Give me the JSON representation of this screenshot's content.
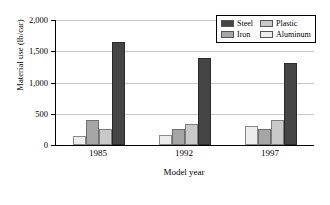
{
  "chart_data": {
    "type": "bar",
    "title": "",
    "xlabel": "Model year",
    "ylabel": "Material use (lb/car)",
    "categories": [
      "1985",
      "1992",
      "1997"
    ],
    "series": [
      {
        "name": "Aluminum",
        "color": "#ededed",
        "values": [
          140,
          160,
          300
        ]
      },
      {
        "name": "Iron",
        "color": "#a6a6a6",
        "values": [
          400,
          250,
          250
        ]
      },
      {
        "name": "Plastic",
        "color": "#c9c9c9",
        "values": [
          260,
          340,
          400
        ]
      },
      {
        "name": "Steel",
        "color": "#454545",
        "values": [
          1650,
          1400,
          1320
        ]
      }
    ],
    "ylim": [
      0,
      2000
    ],
    "yticks": [
      "0",
      "500",
      "1,000",
      "1,500",
      "2,000"
    ],
    "ytick_values": [
      0,
      500,
      1000,
      1500,
      2000
    ],
    "grid": true,
    "legend_position": "top-right",
    "legend_order": [
      "Steel",
      "Plastic",
      "Iron",
      "Aluminum"
    ],
    "bar_order_in_group": [
      "Aluminum",
      "Iron",
      "Plastic",
      "Steel"
    ]
  },
  "legend": {
    "entries": [
      {
        "label": "Steel",
        "swatch": "steel-swatch"
      },
      {
        "label": "Plastic",
        "swatch": "plastic-swatch"
      },
      {
        "label": "Iron",
        "swatch": "iron-swatch"
      },
      {
        "label": "Aluminum",
        "swatch": "aluminum-swatch"
      }
    ]
  }
}
